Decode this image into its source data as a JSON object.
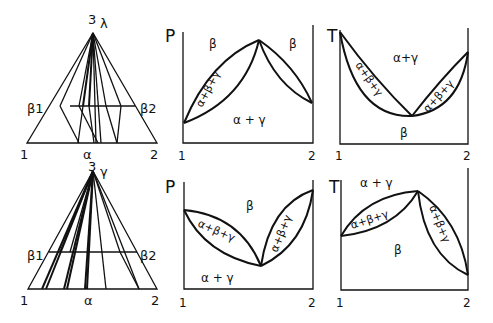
{
  "panels": {
    "top_triangle": {
      "apex_label": "3",
      "apex_phase": "λ",
      "left_label": "β1",
      "right_label": "β2",
      "base_left": "1",
      "base_mid": "α",
      "base_right": "2"
    },
    "top_p": {
      "axis": "P",
      "x_left": "1",
      "x_right": "2",
      "regions": [
        "β",
        "β",
        "α+β+γ",
        "α + γ"
      ]
    },
    "top_t": {
      "axis": "T",
      "x_left": "1",
      "x_right": "2",
      "regions": [
        "α+γ",
        "α+β+γ",
        "α+β+γ",
        "β"
      ]
    },
    "bottom_triangle": {
      "apex_label": "3",
      "apex_phase": "γ",
      "left_label": "β1",
      "right_label": "β2",
      "base_left": "1",
      "base_mid": "α",
      "base_right": "2"
    },
    "bottom_p": {
      "axis": "P",
      "x_left": "1",
      "x_right": "2",
      "regions": [
        "β",
        "α+β+γ",
        "α+β+γ",
        "α + γ"
      ]
    },
    "bottom_t": {
      "axis": "T",
      "x_left": "1",
      "x_right": "2",
      "regions": [
        "α + γ",
        "α+β+γ",
        "β",
        "α+β+γ"
      ]
    }
  }
}
